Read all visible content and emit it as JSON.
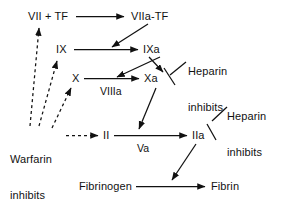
{
  "diagram": {
    "type": "flow-diagram",
    "background_color": "#ffffff",
    "line_color": "#111111",
    "nodes": [
      {
        "id": "vii_tf",
        "label": "VII + TF",
        "x": 28,
        "y": 11
      },
      {
        "id": "viia_tf",
        "label": "VIIa-TF",
        "x": 131,
        "y": 11
      },
      {
        "id": "ix",
        "label": "IX",
        "x": 56,
        "y": 44
      },
      {
        "id": "ixa",
        "label": "IXa",
        "x": 143,
        "y": 44
      },
      {
        "id": "x",
        "label": "X",
        "x": 72,
        "y": 73
      },
      {
        "id": "xa",
        "label": "Xa",
        "x": 144,
        "y": 73
      },
      {
        "id": "ii",
        "label": "II",
        "x": 103,
        "y": 130
      },
      {
        "id": "iia",
        "label": "IIa",
        "x": 192,
        "y": 130
      },
      {
        "id": "fibrinogen",
        "label": "Fibrinogen",
        "x": 79,
        "y": 181
      },
      {
        "id": "fibrin",
        "label": "Fibrin",
        "x": 211,
        "y": 181
      }
    ],
    "edge_labels": [
      {
        "id": "viiia",
        "label": "VIIIa",
        "x": 100,
        "y": 86
      },
      {
        "id": "va",
        "label": "Va",
        "x": 137,
        "y": 143
      }
    ],
    "annotations": [
      {
        "id": "heparin-inhibits-xa",
        "lines": [
          "Heparin",
          "inhibits"
        ],
        "x": 188,
        "y": 41,
        "target": "Xa"
      },
      {
        "id": "heparin-inhibits-iia",
        "lines": [
          "Heparin",
          "inhibits"
        ],
        "x": 227,
        "y": 86,
        "target": "IIa"
      },
      {
        "id": "warfarin-inhibits-synthesis",
        "lines": [
          "Warfarin",
          "inhibits",
          "synthesis"
        ],
        "x": 10,
        "y": 129,
        "target": "VII + TF, IX, X, II"
      }
    ],
    "arrows": [
      {
        "id": "vii-to-viia",
        "from": "VII + TF",
        "to": "VIIa-TF",
        "style": "solid"
      },
      {
        "id": "viia-to-ixa",
        "from": "VIIa-TF",
        "to": "IXa",
        "style": "solid"
      },
      {
        "id": "viia-to-xa",
        "from": "VIIa-TF",
        "to": "Xa",
        "style": "solid"
      },
      {
        "id": "ix-to-ixa",
        "from": "IX",
        "to": "IXa",
        "style": "solid"
      },
      {
        "id": "ixa-to-xa",
        "from": "IXa",
        "to": "Xa",
        "style": "solid"
      },
      {
        "id": "x-to-xa",
        "from": "X",
        "to": "Xa",
        "style": "solid",
        "label": "VIIIa"
      },
      {
        "id": "xa-to-ii",
        "from": "Xa",
        "to": "II-Va line",
        "style": "solid"
      },
      {
        "id": "ii-to-iia",
        "from": "II",
        "to": "IIa",
        "style": "solid",
        "label": "Va"
      },
      {
        "id": "iia-to-fibrin",
        "from": "IIa",
        "to": "Fibrin line",
        "style": "solid"
      },
      {
        "id": "fibrinogen-to-fibrin",
        "from": "Fibrinogen",
        "to": "Fibrin",
        "style": "solid"
      },
      {
        "id": "warfarin-to-vii",
        "from": "Warfarin",
        "to": "VII + TF",
        "style": "dashed"
      },
      {
        "id": "warfarin-to-ix",
        "from": "Warfarin",
        "to": "IX",
        "style": "dashed"
      },
      {
        "id": "warfarin-to-x",
        "from": "Warfarin",
        "to": "X",
        "style": "dashed"
      },
      {
        "id": "warfarin-to-ii",
        "from": "Warfarin",
        "to": "II",
        "style": "dashed"
      }
    ],
    "inhibition_bars": [
      {
        "id": "bar-xa",
        "target": "Xa",
        "from": "heparin-inhibits-xa"
      },
      {
        "id": "bar-iia",
        "target": "IIa",
        "from": "heparin-inhibits-iia"
      }
    ]
  }
}
